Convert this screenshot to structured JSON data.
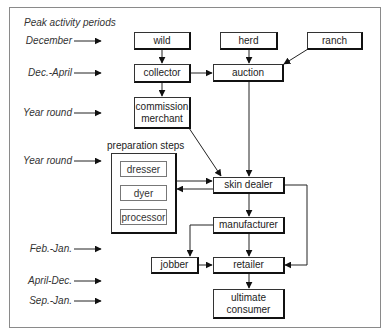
{
  "diagram": {
    "heading": "Peak activity periods",
    "periods": [
      {
        "label": "December",
        "row": "wild"
      },
      {
        "label": "Dec.-April",
        "row": "collector"
      },
      {
        "label": "Year round",
        "row": "commission merchant"
      },
      {
        "label": "Year round",
        "row": "preparation steps"
      },
      {
        "label": "Feb.-Jan.",
        "row": "jobber"
      },
      {
        "label": "April-Dec.",
        "row": "retailer"
      },
      {
        "label": "Sep.-Jan.",
        "row": "ultimate consumer"
      }
    ],
    "nodes": {
      "wild": "wild",
      "herd": "herd",
      "ranch": "ranch",
      "collector": "collector",
      "auction": "auction",
      "commission_merchant_line1": "commission",
      "commission_merchant_line2": "merchant",
      "skin_dealer": "skin dealer",
      "manufacturer": "manufacturer",
      "jobber": "jobber",
      "retailer": "retailer",
      "ultimate_consumer_line1": "ultimate",
      "ultimate_consumer_line2": "consumer"
    },
    "preparation": {
      "title": "preparation steps",
      "steps": [
        "dresser",
        "dyer",
        "processor"
      ]
    },
    "edges": [
      [
        "wild",
        "collector"
      ],
      [
        "collector",
        "auction"
      ],
      [
        "collector",
        "commission merchant"
      ],
      [
        "herd",
        "auction"
      ],
      [
        "ranch",
        "auction"
      ],
      [
        "auction",
        "skin dealer"
      ],
      [
        "commission merchant",
        "skin dealer"
      ],
      [
        "preparation steps",
        "skin dealer"
      ],
      [
        "skin dealer",
        "preparation steps"
      ],
      [
        "skin dealer",
        "manufacturer"
      ],
      [
        "skin dealer",
        "retailer"
      ],
      [
        "manufacturer",
        "jobber"
      ],
      [
        "manufacturer",
        "retailer"
      ],
      [
        "jobber",
        "retailer"
      ],
      [
        "retailer",
        "ultimate consumer"
      ]
    ]
  }
}
